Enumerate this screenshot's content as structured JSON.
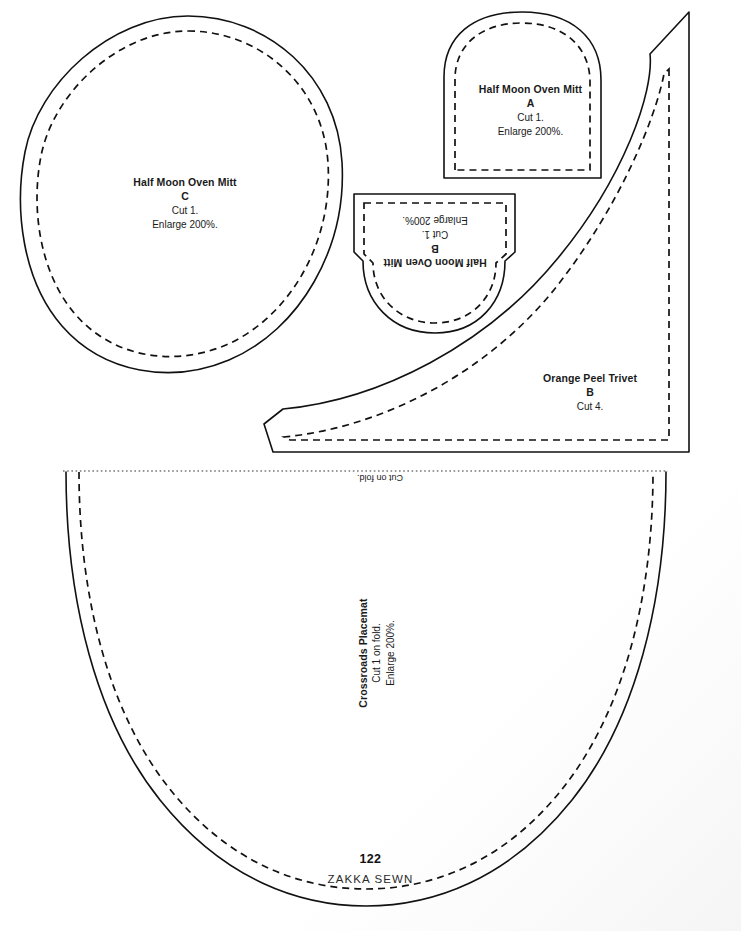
{
  "document": {
    "book_title": "ZAKKA SEWN",
    "page_number": "122",
    "type": "sewing pattern sheet"
  },
  "pieces": {
    "oven_mitt_c": {
      "title": "Half Moon Oven Mitt",
      "piece": "C",
      "cut": "Cut 1.",
      "enlarge": "Enlarge 200%.",
      "shape": "egg-oval",
      "rotation": "0"
    },
    "oven_mitt_a": {
      "title": "Half Moon Oven Mitt",
      "piece": "A",
      "cut": "Cut 1.",
      "enlarge": "Enlarge 200%.",
      "shape": "dome-arch",
      "rotation": "0"
    },
    "oven_mitt_b": {
      "title": "Half Moon Oven Mitt",
      "piece": "B",
      "cut": "Cut 1.",
      "enlarge": "Enlarge 200%.",
      "shape": "inverted-dome",
      "rotation": "180"
    },
    "orange_peel_trivet": {
      "title": "Orange Peel Trivet",
      "piece": "B",
      "cut": "Cut 4.",
      "shape": "petal-leaf",
      "rotation": "0"
    },
    "crossroads_placemat": {
      "title": "Crossroads Placemat",
      "cut": "Cut 1 on fold.",
      "enlarge": "Enlarge 200%.",
      "shape": "half-oval-u",
      "rotation": "-90"
    }
  },
  "markings": {
    "cut_on_fold": "Cut on fold.",
    "line_types": {
      "cut_line": "solid",
      "seam_line": "dashed",
      "fold_line": "dotted"
    }
  },
  "colors": {
    "ink": "#111111",
    "paper": "#ffffff",
    "footer_text": "#2b2b2b"
  }
}
